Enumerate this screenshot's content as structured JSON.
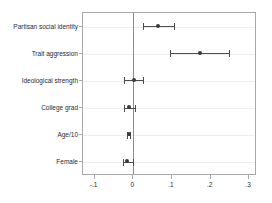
{
  "chart_data": {
    "type": "scatter",
    "plot_style": "coefficient-plot",
    "title": "",
    "subtitle": "",
    "xlabel": "",
    "ylabel": "",
    "xlim": [
      -0.13,
      0.32
    ],
    "grid": true,
    "legend": null,
    "reference_line_x": 0,
    "xticks": [
      -0.1,
      0,
      0.1,
      0.2,
      0.3
    ],
    "xticklabels": [
      "-.1",
      "0",
      ".1",
      ".2",
      ".3"
    ],
    "categories": [
      "Partisan social identity",
      "Trait aggression",
      "Ideological strength",
      "College grad",
      "Age/10",
      "Female"
    ],
    "values": [
      0.065,
      0.172,
      0.001,
      -0.011,
      -0.012,
      -0.015
    ],
    "ci_low": [
      0.025,
      0.095,
      -0.023,
      -0.025,
      -0.016,
      -0.026
    ],
    "ci_high": [
      0.105,
      0.248,
      0.026,
      0.004,
      -0.008,
      0.0
    ],
    "points": [
      {
        "label": "Partisan social identity",
        "estimate": 0.065,
        "ci_low": 0.025,
        "ci_high": 0.105
      },
      {
        "label": "Trait aggression",
        "estimate": 0.172,
        "ci_low": 0.095,
        "ci_high": 0.248
      },
      {
        "label": "Ideological strength",
        "estimate": 0.001,
        "ci_low": -0.023,
        "ci_high": 0.026
      },
      {
        "label": "College grad",
        "estimate": -0.011,
        "ci_low": -0.025,
        "ci_high": 0.004
      },
      {
        "label": "Age/10",
        "estimate": -0.012,
        "ci_low": -0.016,
        "ci_high": -0.008
      },
      {
        "label": "Female",
        "estimate": -0.015,
        "ci_low": -0.026,
        "ci_high": 0.0
      }
    ],
    "colors": {
      "marker": "#3a3a3a",
      "ci": "#4d4d4d",
      "gridline": "#ededed",
      "axis": "#a8a8a8",
      "reference_line": "#8c8c8c",
      "text": "#2b2b2b",
      "background": "#ffffff"
    }
  }
}
